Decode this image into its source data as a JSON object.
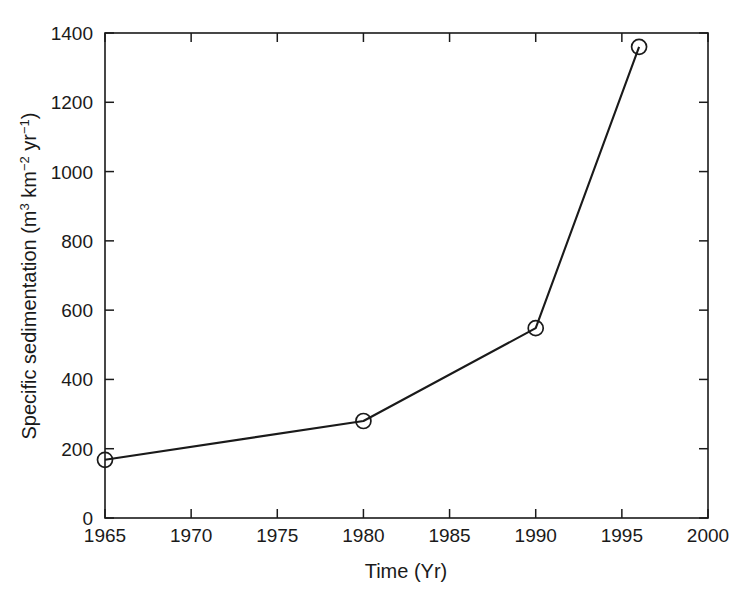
{
  "chart_data": {
    "type": "line",
    "title": "",
    "xlabel": "Time (Yr)",
    "ylabel": "Specific sedimentation (m3 km-2 yr-1)",
    "ylabel_parts": {
      "prefix": "Specific sedimentation (m",
      "sup1": "3",
      "mid1": " km",
      "sup2": "−2",
      "mid2": " yr",
      "sup3": "−1",
      "suffix": ")"
    },
    "x": [
      1965,
      1980,
      1990,
      1996
    ],
    "values": [
      168,
      280,
      548,
      1360
    ],
    "series": [
      {
        "name": "Specific sedimentation",
        "points": [
          {
            "x": 1965,
            "y": 168
          },
          {
            "x": 1980,
            "y": 280
          },
          {
            "x": 1990,
            "y": 548
          },
          {
            "x": 1996,
            "y": 1360
          }
        ]
      }
    ],
    "xlim": [
      1965,
      2000
    ],
    "ylim": [
      0,
      1400
    ],
    "xticks": [
      1965,
      1970,
      1975,
      1980,
      1985,
      1990,
      1995,
      2000
    ],
    "xticklabels": [
      "1965",
      "1970",
      "1975",
      "1980",
      "1985",
      "1990",
      "1995",
      "2000"
    ],
    "yticks": [
      0,
      200,
      400,
      600,
      800,
      1000,
      1200,
      1400
    ],
    "yticklabels": [
      "0",
      "200",
      "400",
      "600",
      "800",
      "1000",
      "1200",
      "1400"
    ],
    "grid": false,
    "legend": null,
    "marker": "open-circle",
    "line_color": "#1a1a1a",
    "background_color": "#ffffff"
  }
}
